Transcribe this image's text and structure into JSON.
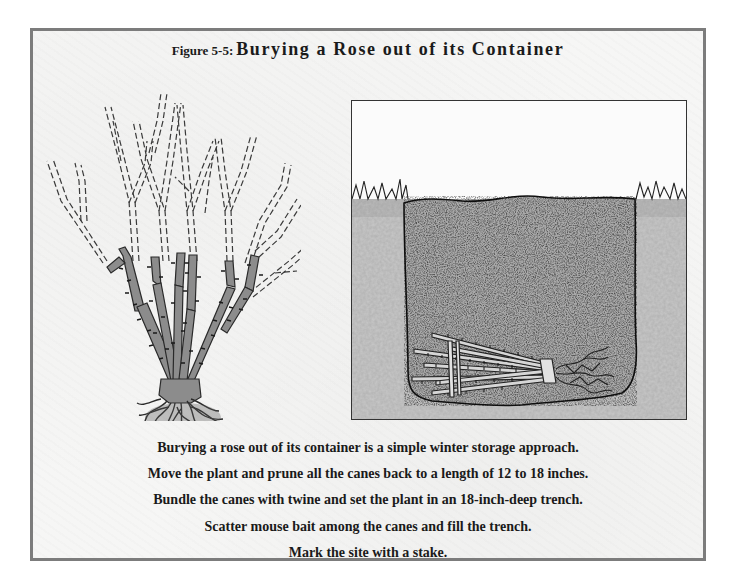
{
  "figure": {
    "label": "Figure 5-5:",
    "title": "Burying a Rose out of its Container"
  },
  "illustrations": {
    "left": {
      "subject": "rose bush with canes pruned back",
      "description": "Rose plant with long canes shown dashed (to be removed) and short thorny canes remaining above the root ball"
    },
    "right": {
      "subject": "trench cross-section",
      "description": "Cross-section of ground with grass at surface, a filled trench, and the bundled rose canes tied with twine lying at the bottom"
    }
  },
  "caption": {
    "lines": [
      "Burying a rose out of its container is a simple winter storage approach.",
      "Move the plant and prune all the canes back to a length of 12 to 18 inches.",
      "Bundle the canes with twine and set the plant in an 18-inch-deep trench.",
      "Scatter mouse bait among the canes and fill the trench.",
      "Mark the site with a stake."
    ]
  },
  "colors": {
    "frame_border": "#7c7c7c",
    "background": "#f6f6f5",
    "cane_fill": "#8a8a8a",
    "cane_outline": "#2a2a2a",
    "ground": "#c9c9c9",
    "soil": "#a9a9a9",
    "text": "#1a1a1a"
  }
}
